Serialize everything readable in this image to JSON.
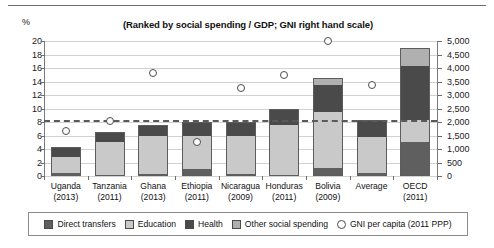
{
  "header": {
    "axis_unit_label": "%",
    "title": "(Ranked by social spending / GDP; GNI right hand scale)"
  },
  "chart_data": {
    "type": "bar",
    "title": "(Ranked by social spending / GDP; GNI right hand scale)",
    "xlabel": "",
    "ylabel": "%",
    "y2label": "",
    "ylim": [
      0,
      20
    ],
    "y2lim": [
      0,
      5000
    ],
    "grid": true,
    "legend_position": "bottom",
    "stacked": true,
    "categories": [
      "Uganda\n(2013)",
      "Tanzania\n(2011)",
      "Ghana\n(2013)",
      "Ethiopia\n(2011)",
      "Nicaragua\n(2009)",
      "Honduras\n(2011)",
      "Bolivia\n(2009)",
      "Average",
      "OECD\n(2011)"
    ],
    "category_names": [
      "Uganda",
      "Tanzania",
      "Ghana",
      "Ethiopia",
      "Nicaragua",
      "Honduras",
      "Bolivia",
      "Average",
      "OECD"
    ],
    "category_years": [
      "(2013)",
      "(2011)",
      "(2013)",
      "(2011)",
      "(2009)",
      "(2011)",
      "(2009)",
      "",
      "(2011)"
    ],
    "series": [
      {
        "name": "Direct transfers",
        "color": "#5f5f5f",
        "values": [
          0.5,
          0.2,
          0.3,
          1.0,
          0.3,
          0.2,
          1.2,
          0.5,
          5.0
        ]
      },
      {
        "name": "Education",
        "color": "#c9c9c9",
        "values": [
          2.3,
          4.8,
          5.6,
          5.0,
          5.6,
          7.3,
          8.3,
          5.3,
          3.3
        ]
      },
      {
        "name": "Health",
        "color": "#4a4a4a",
        "values": [
          1.5,
          1.5,
          1.6,
          2.0,
          2.1,
          2.5,
          4.0,
          2.5,
          8.0
        ]
      },
      {
        "name": "Other social spending",
        "color": "#b0b0b0",
        "values": [
          0.0,
          0.0,
          0.0,
          0.0,
          0.0,
          0.0,
          1.0,
          0.0,
          2.7
        ]
      }
    ],
    "totals": [
      4.3,
      6.5,
      7.5,
      8.0,
      8.0,
      10.0,
      14.5,
      8.3,
      19.0
    ],
    "gni_series": {
      "name": "GNI per capita (2011 PPP)",
      "axis": "right",
      "marker": "open-circle",
      "values": [
        1670,
        2030,
        3830,
        1250,
        3250,
        3750,
        5000,
        3380,
        null
      ],
      "plotted_percent_equivalent": [
        6.7,
        8.1,
        15.3,
        5.0,
        13.0,
        15.0,
        20.0,
        13.5,
        null
      ]
    },
    "average_line": {
      "label": "",
      "value": 8.3,
      "style": "dashed"
    },
    "yticks_left": [
      "0",
      "2",
      "4",
      "6",
      "8",
      "10",
      "12",
      "14",
      "16",
      "18",
      "20"
    ],
    "yticks_right": [
      "0",
      "500",
      "1,000",
      "1,500",
      "2,000",
      "2,500",
      "3,000",
      "3,500",
      "4,000",
      "4,500",
      "5,000"
    ]
  },
  "legend": {
    "items": [
      {
        "label": "Direct transfers",
        "marker": "square",
        "color": "#5f5f5f"
      },
      {
        "label": "Education",
        "marker": "square",
        "color": "#c9c9c9"
      },
      {
        "label": "Health",
        "marker": "square",
        "color": "#4a4a4a"
      },
      {
        "label": "Other social spending",
        "marker": "square",
        "color": "#b0b0b0"
      },
      {
        "label": "GNI per capita (2011 PPP)",
        "marker": "circle",
        "color": "#ffffff"
      }
    ]
  }
}
